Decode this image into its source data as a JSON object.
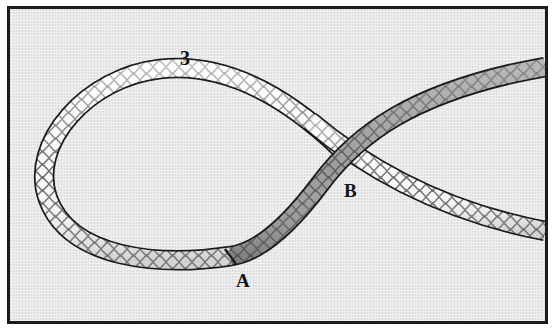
{
  "figure": {
    "type": "line-drawing",
    "background_color": "#e3e3e3",
    "frame_color": "#1c1c1c",
    "page_color": "#ffffff"
  },
  "labels": {
    "step_number": "3",
    "point_a": "A",
    "point_b": "B"
  },
  "ropes": {
    "light": {
      "name": "white-braided-rope",
      "fill_color": "#f7f7f7",
      "outline_color": "#1b1b1b",
      "weave_color": "#7d7d7d",
      "width_px": 17
    },
    "dark": {
      "name": "gray-braided-rope",
      "fill_color": "#9a9a9a",
      "outline_color": "#1b1b1b",
      "weave_color": "#6a6a6a",
      "width_px": 17
    }
  },
  "annotations": {
    "transition_at_a": "rope changes from light to dark shading at mark A",
    "crossing_at_b": "dark rope passes over light rope at crossing B"
  }
}
